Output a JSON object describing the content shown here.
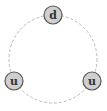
{
  "diagram": {
    "type": "cycle",
    "ring": {
      "cx": 53,
      "cy": 59,
      "r": 44,
      "style": "dashed",
      "color": "#b8b8b8"
    },
    "node_style": {
      "r": 9,
      "fill": "#cfcfcf",
      "stroke": "#555555"
    },
    "nodes": [
      {
        "id": "top",
        "label": "d",
        "x": 53,
        "y": 15
      },
      {
        "id": "bottom-left",
        "label": "u",
        "x": 14,
        "y": 81
      },
      {
        "id": "bottom-right",
        "label": "u",
        "x": 92,
        "y": 81
      }
    ]
  }
}
